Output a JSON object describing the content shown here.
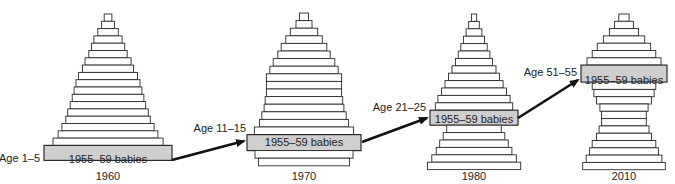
{
  "diagram": {
    "title": "",
    "cohort_label": "1955–59 babies",
    "highlight_color": "#cfcfcf",
    "bar_fill": "#ffffff",
    "stroke_color": "#2a2a2a",
    "arrow_color": "#111111",
    "pyramids": [
      {
        "year": "1960",
        "age_label": "Age 1–5",
        "relative_widths": [
          0.06,
          0.1,
          0.16,
          0.22,
          0.26,
          0.3,
          0.36,
          0.4,
          0.46,
          0.5,
          0.53,
          0.56,
          0.59,
          0.63,
          0.66,
          0.72,
          0.78,
          0.86,
          1.0
        ],
        "highlight_index": 18
      },
      {
        "year": "1970",
        "age_label": "Age 11–15",
        "relative_widths": [
          0.08,
          0.14,
          0.24,
          0.32,
          0.4,
          0.46,
          0.54,
          0.6,
          0.66,
          0.66,
          0.66,
          0.68,
          0.7,
          0.74,
          0.78,
          0.87,
          1.0,
          0.86,
          0.8
        ],
        "highlight_index": 16
      },
      {
        "year": "1980",
        "age_label": "Age 21–25",
        "relative_widths": [
          0.06,
          0.12,
          0.18,
          0.24,
          0.3,
          0.36,
          0.42,
          0.5,
          0.58,
          0.66,
          0.74,
          0.82,
          0.88,
          1.0,
          0.62,
          0.7,
          0.78,
          0.86,
          0.96,
          1.06
        ],
        "highlight_index": 13
      },
      {
        "year": "2010",
        "age_label": "Age 51–55",
        "relative_widths": [
          0.12,
          0.22,
          0.34,
          0.48,
          0.62,
          0.74,
          0.86,
          1.0,
          0.74,
          0.7,
          0.64,
          0.56,
          0.52,
          0.52,
          0.58,
          0.64,
          0.74,
          0.8,
          0.88,
          0.96
        ],
        "highlight_index": 7
      }
    ]
  }
}
